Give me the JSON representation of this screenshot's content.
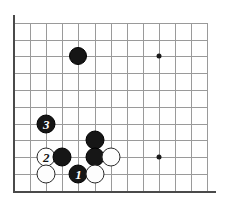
{
  "figure": {
    "type": "go-board-diagram",
    "board": {
      "origin_x": 14,
      "origin_y": 22.7,
      "col_spacing": 16.1,
      "row_spacing": 16.8,
      "cols": 13,
      "rows": 11,
      "line_color": "#9a9a9a",
      "edge_color": "#4a4a4a",
      "background_color": "#ffffff"
    },
    "star_points": [
      {
        "name": "star-point-upper-right",
        "col": 9,
        "row": 2
      },
      {
        "name": "star-point-lower-right",
        "col": 9,
        "row": 8
      }
    ],
    "stones": [
      {
        "name": "black-stone-corner-approach",
        "color": "black",
        "col": 4,
        "row": 2,
        "label": "",
        "radius": 9
      },
      {
        "name": "black-stone-move-3",
        "color": "black",
        "col": 2,
        "row": 6,
        "label": "3",
        "radius": 9.5
      },
      {
        "name": "black-stone-upper-center",
        "color": "black",
        "col": 5,
        "row": 7,
        "label": "",
        "radius": 9.5
      },
      {
        "name": "white-stone-move-2",
        "color": "white",
        "col": 2,
        "row": 8,
        "label": "2",
        "radius": 9.5
      },
      {
        "name": "black-stone-left-group",
        "color": "black",
        "col": 3,
        "row": 8,
        "label": "",
        "radius": 9.5
      },
      {
        "name": "black-stone-center-group",
        "color": "black",
        "col": 5,
        "row": 8,
        "label": "",
        "radius": 9.5
      },
      {
        "name": "white-stone-right-wall",
        "color": "white",
        "col": 6,
        "row": 8,
        "label": "",
        "radius": 9.5
      },
      {
        "name": "white-stone-lower-left",
        "color": "white",
        "col": 2,
        "row": 9,
        "label": "",
        "radius": 9.5
      },
      {
        "name": "black-stone-move-1",
        "color": "black",
        "col": 4,
        "row": 9,
        "label": "1",
        "radius": 9.5
      },
      {
        "name": "white-stone-lower-center",
        "color": "white",
        "col": 5,
        "row": 9,
        "label": "",
        "radius": 9.5
      }
    ],
    "move_labels": {
      "move_1": "1",
      "move_2": "2",
      "move_3": "3"
    }
  }
}
